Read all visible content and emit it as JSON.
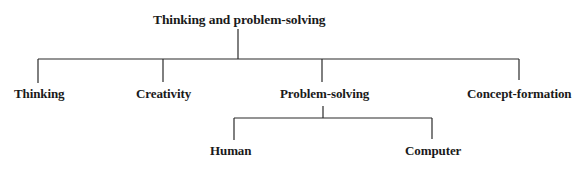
{
  "diagram": {
    "type": "tree",
    "root": {
      "label": "Thinking and problem-solving"
    },
    "level1": [
      {
        "label": "Thinking"
      },
      {
        "label": "Creativity"
      },
      {
        "label": "Problem-solving"
      },
      {
        "label": "Concept-formation"
      }
    ],
    "level2": [
      {
        "parent": "Problem-solving",
        "label": "Human"
      },
      {
        "parent": "Problem-solving",
        "label": "Computer"
      }
    ],
    "colors": {
      "line": "#2a2a2a",
      "text": "#1a1a1a",
      "background": "#ffffff"
    }
  }
}
